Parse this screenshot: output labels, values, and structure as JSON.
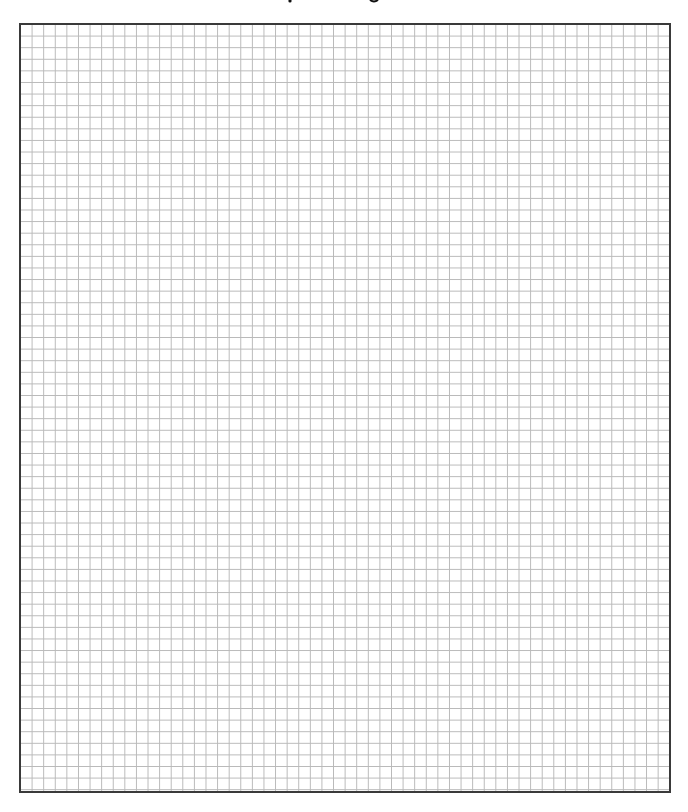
{
  "page": {
    "title": "",
    "title_note": "title text cut off at top edge; only descender fragments visible"
  },
  "grid": {
    "columns": 56,
    "rows": 66,
    "cell_size_px": 11.6,
    "line_color": "#b9b9b9",
    "border_color": "#3a3a3a",
    "background_color": "#ffffff"
  }
}
